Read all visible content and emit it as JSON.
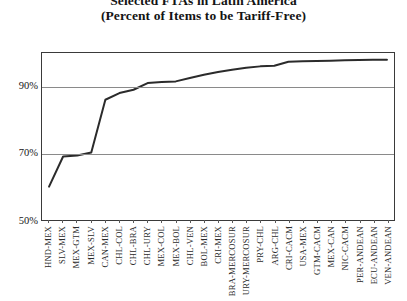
{
  "chart_data": {
    "type": "line",
    "title": "Selected FTAs in Latin America",
    "subtitle": "(Percent of Items to be Tariff-Free)",
    "xlabel": "",
    "ylabel": "",
    "ylim": [
      50,
      100
    ],
    "yticks": [
      50,
      70,
      90
    ],
    "ytick_labels": [
      "50%",
      "70%",
      "90%"
    ],
    "grid": true,
    "legend": "none",
    "line_color": "#2b2b2b",
    "categories": [
      "HND-MEX",
      "SLV-MEX",
      "MEX-GTM",
      "MEX-SLV",
      "CAN-MEX",
      "CHL-COL",
      "CHL-BRA",
      "CHL-URY",
      "MEX-COL",
      "MEX-BOL",
      "CHL-VEN",
      "BOL-MEX",
      "CRI-MEX",
      "BRA-MERCOSUR",
      "URY-MERCOSUR",
      "PRY-CHL",
      "ARG-CHL",
      "CRI-CACM",
      "USA-MEX",
      "GTM-CACM",
      "MEX-CAN",
      "NIC-CACM",
      "PER-ANDEAN",
      "ECU-ANDEAN",
      "VEN-ANDEAN"
    ],
    "values": [
      60.0,
      69.0,
      69.3,
      70.2,
      86.0,
      88.0,
      89.0,
      91.0,
      91.3,
      91.5,
      92.5,
      93.5,
      94.3,
      95.0,
      95.6,
      96.0,
      96.2,
      97.4,
      97.5,
      97.6,
      97.7,
      97.8,
      97.9,
      98.0,
      98.0
    ]
  }
}
